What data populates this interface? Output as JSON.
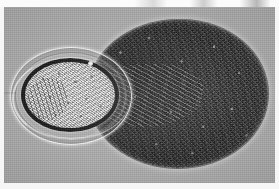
{
  "image": {
    "kind": "photomicrograph",
    "modality": "differential interference contrast light microscopy",
    "palette": "grayscale",
    "width_px": 279,
    "height_px": 189,
    "border": {
      "style": "white photographic margin",
      "color": "#ffffff"
    },
    "field": {
      "background_color": "#acacac",
      "description": "uniform mid-gray mounting medium with fine film grain"
    },
    "artifacts": {
      "top_strip": "faint dark scan streaks along the upper edge",
      "grain": "fine photographic grain across the entire field"
    }
  },
  "subjects": [
    {
      "id": "ovum",
      "label": "small ovoid body",
      "position": "left",
      "approx_bbox_px": [
        6,
        47,
        120,
        96
      ],
      "outline": "ellipse, long axis horizontal",
      "layers": [
        {
          "name": "outer envelope",
          "tone": "translucent pale gray",
          "color": "#c8c8c8"
        },
        {
          "name": "inner shell ring",
          "tone": "thin gray outline",
          "color": "#787878"
        },
        {
          "name": "thick dark rim",
          "tone": "near-black",
          "color": "#1b1b1b"
        },
        {
          "name": "granular core",
          "tone": "bright light gray",
          "color": "#e0e0e0"
        }
      ],
      "features": [
        "dense fine granular contents filling the core",
        "curved darker striae along the left of the core",
        "small bright opercular dot on the upper rim",
        "bright specular crescent along the lower-left envelope",
        "thin filament trailing to the far left"
      ]
    },
    {
      "id": "mass",
      "label": "large dark textured mass",
      "position": "right",
      "approx_bbox_px": [
        84,
        20,
        180,
        148
      ],
      "outline": "broad ovoid, long axis horizontal",
      "tone": "dark charcoal",
      "color": "#3a3a3a",
      "features": [
        "densely speckled granular interior with high local contrast",
        "radiating fibrous striations emerging near the junction with the ovum",
        "bright refractive halo rim around the outer margin",
        "concave notch on the left where the ovum abuts"
      ]
    }
  ],
  "relationship": {
    "description": "the small bright ovoid overlaps the left margin of the large dark mass",
    "junction_px": [
      84,
      95
    ]
  }
}
